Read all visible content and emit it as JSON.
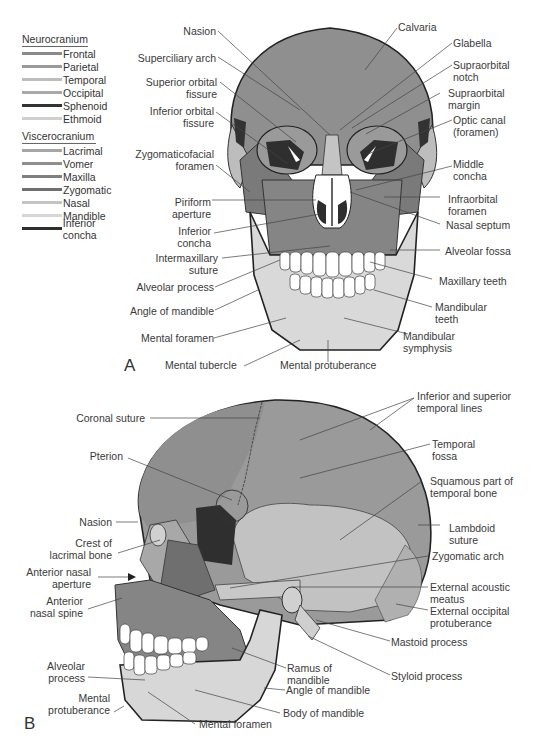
{
  "legend": {
    "neurocranium": {
      "title": "Neurocranium",
      "items": [
        {
          "label": "Frontal",
          "color": "#8a8a8a"
        },
        {
          "label": "Parietal",
          "color": "#9a9a9a"
        },
        {
          "label": "Temporal",
          "color": "#bdbdbd"
        },
        {
          "label": "Occipital",
          "color": "#a9a9a9"
        },
        {
          "label": "Sphenoid",
          "color": "#333333"
        },
        {
          "label": "Ethmoid",
          "color": "#cfcfcf"
        }
      ]
    },
    "viscerocranium": {
      "title": "Viscerocranium",
      "items": [
        {
          "label": "Lacrimal",
          "color": "#a5a5a5"
        },
        {
          "label": "Vomer",
          "color": "#8f8f8f"
        },
        {
          "label": "Maxilla",
          "color": "#7f7f7f"
        },
        {
          "label": "Zygomatic",
          "color": "#6f6f6f"
        },
        {
          "label": "Nasal",
          "color": "#c4c4c4"
        },
        {
          "label": "Mandible",
          "color": "#d6d6d6"
        },
        {
          "label": "Inferior concha",
          "color": "#2e2e2e"
        }
      ]
    }
  },
  "panel_a": {
    "letter": "A",
    "labels_left": [
      "Nasion",
      "Superciliary arch",
      "Superior orbital fissure",
      "Inferior orbital fissure",
      "Zygomaticofacial foramen",
      "Piriform aperture",
      "Inferior concha",
      "Intermaxillary suture",
      "Alveolar process",
      "Angle of mandible",
      "Mental foramen",
      "Mental tubercle"
    ],
    "labels": {
      "nasion": "Nasion",
      "superciliary_arch": "Superciliary arch",
      "superior_orbital_fissure_1": "Superior orbital",
      "superior_orbital_fissure_2": "fissure",
      "inferior_orbital_fissure_1": "Inferior orbital",
      "inferior_orbital_fissure_2": "fissure",
      "zygomaticofacial_1": "Zygomaticofacial",
      "zygomaticofacial_2": "foramen",
      "piriform_1": "Piriform",
      "piriform_2": "aperture",
      "inferior_concha_1": "Inferior",
      "inferior_concha_2": "concha",
      "intermaxillary_1": "Intermaxillary",
      "intermaxillary_2": "suture",
      "alveolar_process": "Alveolar process",
      "angle_of_mandible": "Angle of mandible",
      "mental_foramen": "Mental foramen",
      "mental_tubercle": "Mental tubercle",
      "mental_protuberance": "Mental protuberance",
      "calvaria": "Calvaria",
      "glabella": "Glabella",
      "supraorbital_notch_1": "Supraorbital",
      "supraorbital_notch_2": "notch",
      "supraorbital_margin_1": "Supraorbital",
      "supraorbital_margin_2": "margin",
      "optic_canal_1": "Optic canal",
      "optic_canal_2": "(foramen)",
      "middle_concha_1": "Middle",
      "middle_concha_2": "concha",
      "infraorbital_foramen_1": "Infraorbital",
      "infraorbital_foramen_2": "foramen",
      "nasal_septum": "Nasal septum",
      "alveolar_fossa": "Alveolar fossa",
      "maxillary_teeth": "Maxillary teeth",
      "mandibular_teeth_1": "Mandibular",
      "mandibular_teeth_2": "teeth",
      "mandibular_symphysis_1": "Mandibular",
      "mandibular_symphysis_2": "symphysis"
    }
  },
  "panel_b": {
    "letter": "B",
    "labels": {
      "coronal_suture": "Coronal suture",
      "pterion": "Pterion",
      "nasion": "Nasion",
      "crest_lacrimal_1": "Crest of",
      "crest_lacrimal_2": "lacrimal bone",
      "anterior_nasal_aperture_1": "Anterior nasal",
      "anterior_nasal_aperture_2": "aperture",
      "anterior_nasal_spine_1": "Anterior",
      "anterior_nasal_spine_2": "nasal spine",
      "alveolar_process_1": "Alveolar",
      "alveolar_process_2": "process",
      "mental_protuberance_1": "Mental",
      "mental_protuberance_2": "protuberance",
      "mental_foramen": "Mental foramen",
      "temporal_lines_1": "Inferior and superior",
      "temporal_lines_2": "temporal lines",
      "temporal_fossa_1": "Temporal",
      "temporal_fossa_2": "fossa",
      "squamous_1": "Squamous part of",
      "squamous_2": "temporal bone",
      "lambdoid_1": "Lambdoid",
      "lambdoid_2": "suture",
      "zygomatic_arch": "Zygomatic arch",
      "external_acoustic_1": "External acoustic",
      "external_acoustic_2": "meatus",
      "external_occipital_1": "External occipital",
      "external_occipital_2": "protuberance",
      "mastoid_process": "Mastoid process",
      "styloid_process": "Styloid process",
      "ramus_1": "Ramus of",
      "ramus_2": "mandible",
      "angle_of_mandible": "Angle of mandible",
      "body_of_mandible": "Body of mandible"
    }
  }
}
